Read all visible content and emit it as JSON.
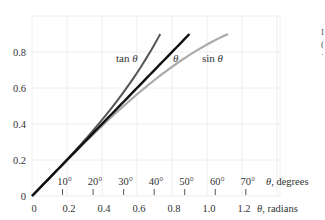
{
  "chart_data": {
    "type": "line",
    "title": "",
    "xlabel_degrees": "θ, degrees",
    "xlabel_radians": "θ, radians",
    "ylabel": "",
    "xlim_radians": [
      0,
      1.4
    ],
    "ylim": [
      0,
      0.9
    ],
    "grid": true,
    "legend": "inline curve labels",
    "y_ticks": [
      {
        "value": 0,
        "label": "0"
      },
      {
        "value": 0.2,
        "label": "0.2"
      },
      {
        "value": 0.4,
        "label": "0.4"
      },
      {
        "value": 0.6,
        "label": "0.6"
      },
      {
        "value": 0.8,
        "label": "0.8"
      }
    ],
    "x_ticks_radians": [
      {
        "value": 0,
        "label": "0"
      },
      {
        "value": 0.2,
        "label": "0.2"
      },
      {
        "value": 0.4,
        "label": "0.4"
      },
      {
        "value": 0.6,
        "label": "0.6"
      },
      {
        "value": 0.8,
        "label": "0.8"
      },
      {
        "value": 1.0,
        "label": "1.0"
      },
      {
        "value": 1.2,
        "label": "1.2"
      }
    ],
    "x_ticks_degrees": [
      {
        "value": 10,
        "label": "10°"
      },
      {
        "value": 20,
        "label": "20°"
      },
      {
        "value": 30,
        "label": "30°"
      },
      {
        "value": 40,
        "label": "40°"
      },
      {
        "value": 50,
        "label": "50°"
      },
      {
        "value": 60,
        "label": "60°"
      },
      {
        "value": 70,
        "label": "70°"
      }
    ],
    "series": [
      {
        "name": "tan θ",
        "color": "#555555",
        "function": "tan",
        "x_range_radians": [
          0,
          0.733
        ],
        "y_end": 0.9,
        "sample_points": [
          [
            0,
            0
          ],
          [
            0.2,
            0.203
          ],
          [
            0.4,
            0.423
          ],
          [
            0.6,
            0.684
          ],
          [
            0.733,
            0.9
          ]
        ]
      },
      {
        "name": "θ",
        "color": "#111111",
        "function": "identity",
        "x_range_radians": [
          0,
          0.9
        ],
        "y_end": 0.9,
        "sample_points": [
          [
            0,
            0
          ],
          [
            0.2,
            0.2
          ],
          [
            0.4,
            0.4
          ],
          [
            0.6,
            0.6
          ],
          [
            0.8,
            0.8
          ],
          [
            0.9,
            0.9
          ]
        ]
      },
      {
        "name": "sin θ",
        "color": "#aaaaaa",
        "function": "sin",
        "x_range_radians": [
          0,
          1.12
        ],
        "y_end": 0.9,
        "sample_points": [
          [
            0,
            0
          ],
          [
            0.2,
            0.199
          ],
          [
            0.4,
            0.389
          ],
          [
            0.6,
            0.565
          ],
          [
            0.8,
            0.717
          ],
          [
            1.0,
            0.841
          ],
          [
            1.12,
            0.9
          ]
        ]
      }
    ]
  },
  "labels": {
    "tan": "tan θ",
    "theta": "θ",
    "sin": "sin θ",
    "degrees_axis": "θ, degrees",
    "radians_axis": "θ, radians"
  },
  "colors": {
    "grid": "#eeeeee",
    "theta": "#111111",
    "tan": "#555555",
    "sin": "#aaaaaa",
    "text": "#333333"
  }
}
